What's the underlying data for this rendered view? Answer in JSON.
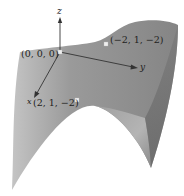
{
  "figure": {
    "type": "3d-surface-diagram",
    "colors": {
      "surface_main": "#8f8f8f",
      "surface_light": "#b8b8b8",
      "surface_inner": "#a9a9a9",
      "surface_dark": "#6f6f6f",
      "axis": "#333333",
      "point": "#f0f0f0",
      "text": "#222222"
    },
    "axes": {
      "x_label": "x",
      "y_label": "y",
      "z_label": "z"
    },
    "points": [
      {
        "label": "(0, 0, 0)",
        "coords": [
          0,
          0,
          0
        ]
      },
      {
        "label": "(−2, 1, −2)",
        "coords": [
          -2,
          1,
          -2
        ]
      },
      {
        "label": "(2, 1, −2)",
        "coords": [
          2,
          1,
          -2
        ]
      }
    ]
  }
}
